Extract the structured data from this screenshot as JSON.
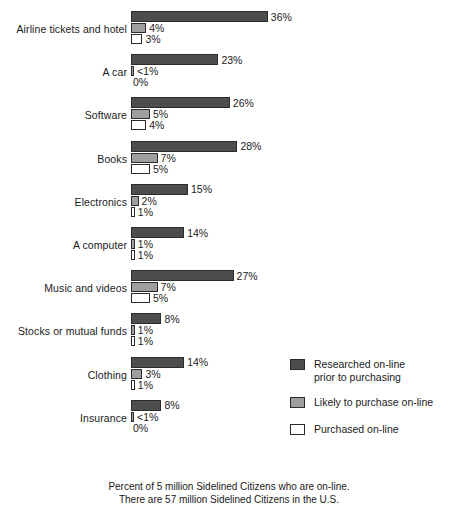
{
  "chart_data": {
    "type": "bar",
    "orientation": "horizontal",
    "title": "",
    "xlabel": "",
    "ylabel": "",
    "grid": false,
    "xlim": [
      0,
      36
    ],
    "legend_position": "bottom-right",
    "categories": [
      "Airline tickets and hotel",
      "A car",
      "Software",
      "Books",
      "Electronics",
      "A computer",
      "Music and videos",
      "Stocks or mutual funds",
      "Clothing",
      "Insurance"
    ],
    "series": [
      {
        "name": "Researched on-line prior to purchasing",
        "color": "#4d4d4d",
        "values": [
          36,
          23,
          26,
          28,
          15,
          14,
          27,
          8,
          14,
          8
        ],
        "labels": [
          "36%",
          "23%",
          "26%",
          "28%",
          "15%",
          "14%",
          "27%",
          "8%",
          "14%",
          "8%"
        ]
      },
      {
        "name": "Likely to purchase on-line",
        "color": "#9e9e9e",
        "values": [
          4,
          0.5,
          5,
          7,
          2,
          1,
          7,
          1,
          3,
          0.5
        ],
        "labels": [
          "4%",
          "<1%",
          "5%",
          "7%",
          "2%",
          "1%",
          "7%",
          "1%",
          "3%",
          "<1%"
        ]
      },
      {
        "name": "Purchased on-line",
        "color": "#ffffff",
        "values": [
          3,
          0,
          4,
          5,
          1,
          1,
          5,
          1,
          1,
          0
        ],
        "labels": [
          "3%",
          "0%",
          "4%",
          "5%",
          "1%",
          "1%",
          "5%",
          "1%",
          "1%",
          "0%"
        ]
      }
    ],
    "caption": "Percent of 5 million Sidelined Citizens who are on-line.\nThere are 57 million Sidelined Citizens in the U.S."
  },
  "legend": {
    "items": [
      {
        "label": "Researched on-line\nprior to purchasing",
        "swatch": "dark"
      },
      {
        "label": "Likely to purchase on-line",
        "swatch": "medium"
      },
      {
        "label": "Purchased on-line",
        "swatch": "white"
      }
    ]
  }
}
